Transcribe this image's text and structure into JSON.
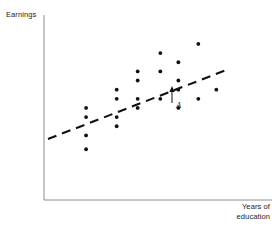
{
  "chart_data": {
    "type": "scatter",
    "title": "",
    "xlabel": "Years of education",
    "ylabel": "Earnings",
    "xlim": [
      0,
      100
    ],
    "ylim": [
      0,
      100
    ],
    "grid": false,
    "legend": null,
    "axes": {
      "x_axis_shown": true,
      "y_axis_shown": true,
      "ticks_shown": false,
      "tick_labels": []
    },
    "points": [
      {
        "x": 17.2,
        "y": 50.6
      },
      {
        "x": 17.2,
        "y": 45.2
      },
      {
        "x": 17.2,
        "y": 34.4
      },
      {
        "x": 17.2,
        "y": 26.3
      },
      {
        "x": 31.8,
        "y": 61.3
      },
      {
        "x": 31.8,
        "y": 55.9
      },
      {
        "x": 31.8,
        "y": 45.2
      },
      {
        "x": 31.8,
        "y": 39.8
      },
      {
        "x": 41.8,
        "y": 72.0
      },
      {
        "x": 41.8,
        "y": 66.7
      },
      {
        "x": 41.8,
        "y": 55.9
      },
      {
        "x": 41.8,
        "y": 50.6
      },
      {
        "x": 52.6,
        "y": 82.8
      },
      {
        "x": 52.6,
        "y": 72.0
      },
      {
        "x": 52.6,
        "y": 55.9
      },
      {
        "x": 61.2,
        "y": 77.4
      },
      {
        "x": 61.2,
        "y": 66.7
      },
      {
        "x": 61.2,
        "y": 61.3
      },
      {
        "x": 61.2,
        "y": 50.6
      },
      {
        "x": 70.7,
        "y": 88.2
      },
      {
        "x": 70.7,
        "y": 55.9
      },
      {
        "x": 79.3,
        "y": 61.3
      }
    ],
    "highlighted_point": {
      "label": "A",
      "x": 61.2,
      "y": 50.6,
      "annotation": "arrow-up-to-regression-line"
    },
    "regression_line": {
      "style": "dashed",
      "x_start": 1.7,
      "y_start": 33.5,
      "x_end": 79.3,
      "y_end": 71.4,
      "color": "#111111"
    },
    "marker": {
      "shape": "dot",
      "color": "#111111",
      "size_px": 2.4
    }
  },
  "labels": {
    "y_axis": "Earnings",
    "x_axis_line1": "Years of",
    "x_axis_line2": "education",
    "point_a": "A"
  },
  "colors": {
    "axis": "#8c8c8c",
    "marker": "#111111",
    "line": "#111111",
    "text": "#1a1a1a",
    "background": "#ffffff"
  }
}
